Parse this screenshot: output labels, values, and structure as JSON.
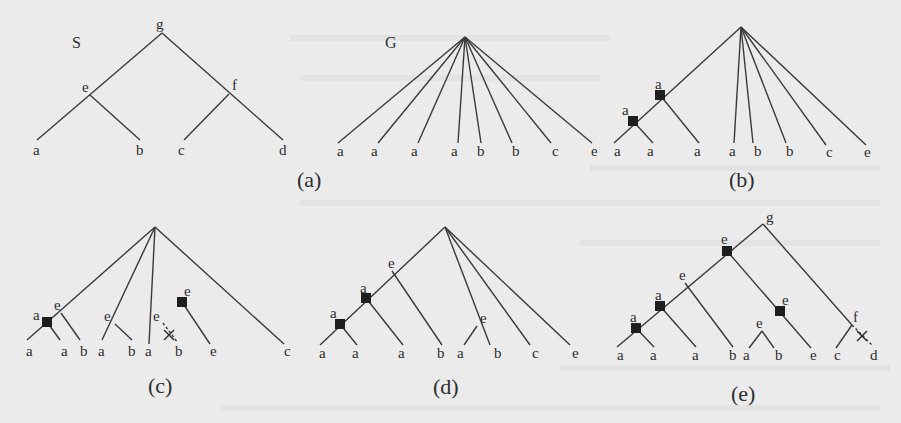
{
  "figure": {
    "colors": {
      "background": "#ebebeb",
      "edge": "#3a3a3a",
      "label": "#2e2e2e",
      "duplication_square": "#1e1e1e"
    }
  },
  "trees": [
    {
      "id": "S",
      "name_label": "S",
      "name_pos": [
        72,
        48
      ],
      "nodes": [
        {
          "id": "g",
          "x": 162,
          "y": 33,
          "label": "g",
          "lx": 156,
          "ly": 29
        },
        {
          "id": "e",
          "x": 90,
          "y": 95,
          "label": "e",
          "lx": 82,
          "ly": 92
        },
        {
          "id": "f",
          "x": 229,
          "y": 94,
          "label": "f",
          "lx": 232,
          "ly": 90
        },
        {
          "id": "l1",
          "x": 37,
          "y": 140,
          "label": "a",
          "lx": 33,
          "ly": 155
        },
        {
          "id": "l2",
          "x": 140,
          "y": 140,
          "label": "b",
          "lx": 136,
          "ly": 155
        },
        {
          "id": "l3",
          "x": 184,
          "y": 140,
          "label": "c",
          "lx": 178,
          "ly": 155
        },
        {
          "id": "l4",
          "x": 283,
          "y": 140,
          "label": "d",
          "lx": 279,
          "ly": 155
        }
      ],
      "edges": [
        [
          "g",
          "l1"
        ],
        [
          "e",
          "l2"
        ],
        [
          "g",
          "l4"
        ],
        [
          "f",
          "l3"
        ]
      ],
      "caption": ""
    },
    {
      "id": "G",
      "name_label": "G",
      "name_pos": [
        385,
        48
      ],
      "nodes": [
        {
          "id": "r",
          "x": 465,
          "y": 37,
          "label": ""
        },
        {
          "id": "l1",
          "x": 338,
          "y": 143,
          "label": "a",
          "lx": 337,
          "ly": 156
        },
        {
          "id": "l2",
          "x": 378,
          "y": 143,
          "label": "a",
          "lx": 371,
          "ly": 156
        },
        {
          "id": "l3",
          "x": 418,
          "y": 143,
          "label": "a",
          "lx": 411,
          "ly": 156
        },
        {
          "id": "l4",
          "x": 458,
          "y": 143,
          "label": "a",
          "lx": 451,
          "ly": 156
        },
        {
          "id": "l5",
          "x": 481,
          "y": 143,
          "label": "b",
          "lx": 477,
          "ly": 156
        },
        {
          "id": "l6",
          "x": 512,
          "y": 143,
          "label": "b",
          "lx": 512,
          "ly": 156
        },
        {
          "id": "l7",
          "x": 551,
          "y": 143,
          "label": "c",
          "lx": 552,
          "ly": 156
        },
        {
          "id": "l8",
          "x": 592,
          "y": 143,
          "label": "e",
          "lx": 591,
          "ly": 156
        }
      ],
      "edges": [
        [
          "r",
          "l1"
        ],
        [
          "r",
          "l2"
        ],
        [
          "r",
          "l3"
        ],
        [
          "r",
          "l4"
        ],
        [
          "r",
          "l5"
        ],
        [
          "r",
          "l6"
        ],
        [
          "r",
          "l7"
        ],
        [
          "r",
          "l8"
        ]
      ],
      "caption": "(a)",
      "caption_pos": [
        297,
        187
      ]
    },
    {
      "id": "b",
      "name_label": "",
      "nodes": [
        {
          "id": "r",
          "x": 741,
          "y": 27,
          "label": ""
        },
        {
          "id": "d1",
          "x": 660,
          "y": 95,
          "label": "a",
          "lx": 655,
          "ly": 89,
          "dup": true
        },
        {
          "id": "d2",
          "x": 633,
          "y": 121,
          "label": "a",
          "lx": 622,
          "ly": 115,
          "dup": true
        },
        {
          "id": "l1",
          "x": 614,
          "y": 143,
          "label": "a",
          "lx": 614,
          "ly": 156
        },
        {
          "id": "l2",
          "x": 653,
          "y": 143,
          "label": "a",
          "lx": 647,
          "ly": 156
        },
        {
          "id": "l3",
          "x": 699,
          "y": 143,
          "label": "a",
          "lx": 694,
          "ly": 156
        },
        {
          "id": "l4",
          "x": 734,
          "y": 143,
          "label": "a",
          "lx": 729,
          "ly": 156
        },
        {
          "id": "l5",
          "x": 753,
          "y": 143,
          "label": "b",
          "lx": 754,
          "ly": 156
        },
        {
          "id": "l6",
          "x": 786,
          "y": 143,
          "label": "b",
          "lx": 786,
          "ly": 156
        },
        {
          "id": "l7",
          "x": 826,
          "y": 145,
          "label": "c",
          "lx": 826,
          "ly": 157
        },
        {
          "id": "l8",
          "x": 866,
          "y": 145,
          "label": "e",
          "lx": 864,
          "ly": 157
        }
      ],
      "edges": [
        [
          "r",
          "l1"
        ],
        [
          "d1",
          "l3"
        ],
        [
          "d2",
          "l2"
        ],
        [
          "r",
          "l4"
        ],
        [
          "r",
          "l5"
        ],
        [
          "r",
          "l6"
        ],
        [
          "r",
          "l7"
        ],
        [
          "r",
          "l8"
        ]
      ],
      "caption": "(b)",
      "caption_pos": [
        729,
        187
      ]
    },
    {
      "id": "c",
      "name_label": "",
      "nodes": [
        {
          "id": "r",
          "x": 155,
          "y": 227,
          "label": ""
        },
        {
          "id": "e1",
          "x": 61,
          "y": 313,
          "label": "e",
          "lx": 54,
          "ly": 310
        },
        {
          "id": "d1",
          "x": 47,
          "y": 322,
          "label": "a",
          "lx": 33,
          "ly": 320,
          "dup": true
        },
        {
          "id": "e2",
          "x": 115,
          "y": 324,
          "label": "e",
          "lx": 104,
          "ly": 321
        },
        {
          "id": "d2",
          "x": 182,
          "y": 302,
          "label": "e",
          "lx": 184,
          "ly": 296,
          "dup": true
        },
        {
          "id": "e3",
          "x": 163,
          "y": 323,
          "label": "e",
          "lx": 153,
          "ly": 321
        },
        {
          "id": "l1",
          "x": 27,
          "y": 340,
          "label": "a",
          "lx": 26,
          "ly": 356
        },
        {
          "id": "l2",
          "x": 60,
          "y": 340,
          "label": "a",
          "lx": 61,
          "ly": 356
        },
        {
          "id": "l3",
          "x": 80,
          "y": 340,
          "label": "b",
          "lx": 80,
          "ly": 356
        },
        {
          "id": "l4",
          "x": 102,
          "y": 340,
          "label": "a",
          "lx": 98,
          "ly": 356
        },
        {
          "id": "l5",
          "x": 132,
          "y": 340,
          "label": "b",
          "lx": 128,
          "ly": 356
        },
        {
          "id": "l6",
          "x": 149,
          "y": 344,
          "label": "a",
          "lx": 145,
          "ly": 356
        },
        {
          "id": "l7",
          "x": 178,
          "y": 343,
          "label": "b",
          "lx": 175,
          "ly": 356
        },
        {
          "id": "l8",
          "x": 210,
          "y": 344,
          "label": "e",
          "lx": 210,
          "ly": 356
        },
        {
          "id": "l9",
          "x": 284,
          "y": 344,
          "label": "c",
          "lx": 284,
          "ly": 356
        }
      ],
      "edges": [
        [
          "r",
          "l1"
        ],
        [
          "d1",
          "l2"
        ],
        [
          "e1",
          "l3"
        ],
        [
          "r",
          "l4"
        ],
        [
          "e2",
          "l5"
        ],
        [
          "r",
          "l6"
        ],
        [
          "d2",
          "l8"
        ],
        [
          "r",
          "l9"
        ]
      ],
      "dashed_edges": [
        [
          "e3",
          "l7"
        ]
      ],
      "x_marks": [
        [
          169,
          335
        ]
      ],
      "caption": "(c)",
      "caption_pos": [
        148,
        393
      ]
    },
    {
      "id": "d",
      "name_label": "",
      "nodes": [
        {
          "id": "r",
          "x": 445,
          "y": 227,
          "label": ""
        },
        {
          "id": "e1",
          "x": 392,
          "y": 271,
          "label": "e",
          "lx": 388,
          "ly": 268
        },
        {
          "id": "d1",
          "x": 366,
          "y": 298,
          "label": "a",
          "lx": 360,
          "ly": 293,
          "dup": true
        },
        {
          "id": "d2",
          "x": 340,
          "y": 324,
          "label": "a",
          "lx": 330,
          "ly": 318,
          "dup": true
        },
        {
          "id": "e2",
          "x": 477,
          "y": 326,
          "label": "e",
          "lx": 480,
          "ly": 323
        },
        {
          "id": "l1",
          "x": 320,
          "y": 345,
          "label": "a",
          "lx": 319,
          "ly": 358
        },
        {
          "id": "l2",
          "x": 357,
          "y": 345,
          "label": "a",
          "lx": 352,
          "ly": 358
        },
        {
          "id": "l3",
          "x": 403,
          "y": 345,
          "label": "a",
          "lx": 398,
          "ly": 358
        },
        {
          "id": "l4",
          "x": 442,
          "y": 345,
          "label": "b",
          "lx": 437,
          "ly": 358
        },
        {
          "id": "l5",
          "x": 464,
          "y": 345,
          "label": "a",
          "lx": 457,
          "ly": 358
        },
        {
          "id": "l6",
          "x": 490,
          "y": 345,
          "label": "b",
          "lx": 494,
          "ly": 358
        },
        {
          "id": "l7",
          "x": 530,
          "y": 345,
          "label": "c",
          "lx": 532,
          "ly": 358
        },
        {
          "id": "l8",
          "x": 570,
          "y": 345,
          "label": "e",
          "lx": 572,
          "ly": 358
        }
      ],
      "edges": [
        [
          "r",
          "l1"
        ],
        [
          "d2",
          "l2"
        ],
        [
          "d1",
          "l3"
        ],
        [
          "e1",
          "l4"
        ],
        [
          "r",
          "l6"
        ],
        [
          "e2",
          "l5"
        ],
        [
          "r",
          "l7"
        ],
        [
          "r",
          "l8"
        ]
      ],
      "caption": "(d)",
      "caption_pos": [
        433,
        394
      ]
    },
    {
      "id": "e",
      "name_label": "",
      "nodes": [
        {
          "id": "g",
          "x": 763,
          "y": 224,
          "label": "g",
          "lx": 766,
          "ly": 222
        },
        {
          "id": "d0",
          "x": 727,
          "y": 251,
          "label": "e",
          "lx": 721,
          "ly": 244,
          "dup": true
        },
        {
          "id": "e1",
          "x": 685,
          "y": 283,
          "label": "e",
          "lx": 679,
          "ly": 280
        },
        {
          "id": "d1",
          "x": 660,
          "y": 306,
          "label": "a",
          "lx": 655,
          "ly": 300,
          "dup": true
        },
        {
          "id": "d2",
          "x": 636,
          "y": 328,
          "label": "a",
          "lx": 630,
          "ly": 322,
          "dup": true
        },
        {
          "id": "d3",
          "x": 780,
          "y": 311,
          "label": "e",
          "lx": 782,
          "ly": 305,
          "dup": true
        },
        {
          "id": "e2",
          "x": 762,
          "y": 331,
          "label": "e",
          "lx": 756,
          "ly": 328
        },
        {
          "id": "f",
          "x": 852,
          "y": 325,
          "label": "f",
          "lx": 853,
          "ly": 322
        },
        {
          "id": "l1",
          "x": 617,
          "y": 347,
          "label": "a",
          "lx": 617,
          "ly": 360
        },
        {
          "id": "l2",
          "x": 654,
          "y": 347,
          "label": "a",
          "lx": 650,
          "ly": 360
        },
        {
          "id": "l3",
          "x": 696,
          "y": 347,
          "label": "a",
          "lx": 692,
          "ly": 360
        },
        {
          "id": "l4",
          "x": 733,
          "y": 347,
          "label": "b",
          "lx": 729,
          "ly": 360
        },
        {
          "id": "l5",
          "x": 749,
          "y": 348,
          "label": "a",
          "lx": 743,
          "ly": 360
        },
        {
          "id": "l6",
          "x": 774,
          "y": 348,
          "label": "b",
          "lx": 775,
          "ly": 360
        },
        {
          "id": "l7",
          "x": 811,
          "y": 348,
          "label": "e",
          "lx": 810,
          "ly": 360
        },
        {
          "id": "l8",
          "x": 836,
          "y": 348,
          "label": "c",
          "lx": 834,
          "ly": 360
        },
        {
          "id": "l9",
          "x": 873,
          "y": 346,
          "label": "d",
          "lx": 870,
          "ly": 360
        }
      ],
      "edges": [
        [
          "g",
          "l1"
        ],
        [
          "d2",
          "l2"
        ],
        [
          "d1",
          "l3"
        ],
        [
          "e1",
          "l4"
        ],
        [
          "d0",
          "l7"
        ],
        [
          "e2",
          "l5"
        ],
        [
          "e2",
          "l6"
        ],
        [
          "g",
          "f"
        ],
        [
          "f",
          "l8"
        ]
      ],
      "dashed_edges": [
        [
          "f",
          "l9"
        ]
      ],
      "x_marks": [
        [
          862,
          336
        ]
      ],
      "caption": "(e)",
      "caption_pos": [
        731,
        401
      ]
    }
  ]
}
